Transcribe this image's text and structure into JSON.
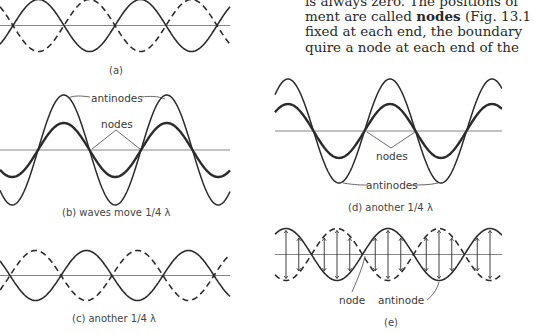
{
  "text": {
    "line1": "is always zero. The positions of",
    "line2_pre": "ment are called ",
    "line2_bold": "nodes",
    "line2_post": " (Fig. 13.1",
    "line3": "fixed at each end, the boundary",
    "line4": "quire a node at each end of the"
  },
  "panels": {
    "a": {
      "caption": "(a)"
    },
    "b": {
      "caption": "(b)  waves move 1/4 λ",
      "label_antinodes": "antinodes",
      "label_nodes": "nodes"
    },
    "c": {
      "caption": "(c)  another 1/4 λ"
    },
    "d": {
      "caption": "(d)  another 1/4 λ",
      "label_nodes": "nodes",
      "label_antinodes": "antinodes"
    },
    "e": {
      "caption": "(e)",
      "label_node": "node",
      "label_antinode": "antinode"
    }
  },
  "colors": {
    "ink": "#2b2b2b",
    "axis": "#555555",
    "text": "#3a3a3a"
  }
}
